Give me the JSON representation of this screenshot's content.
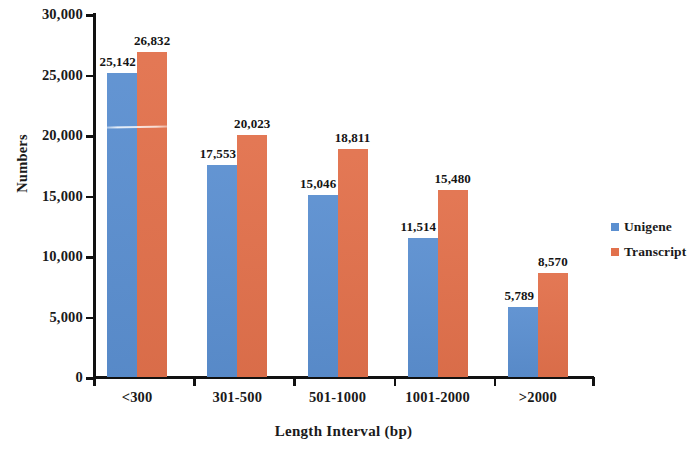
{
  "chart_data": {
    "type": "bar",
    "title": "",
    "subtitle": "",
    "xlabel": "Length Interval (bp)",
    "ylabel": "Numbers",
    "categories": [
      "<300",
      "301-500",
      "501-1000",
      "1001-2000",
      ">2000"
    ],
    "series": [
      {
        "name": "Unigene",
        "color": "#5b8fd0",
        "values": [
          25142,
          17553,
          15046,
          11514,
          5789
        ],
        "value_labels": [
          "25,142",
          "17,553",
          "15,046",
          "11,514",
          "5,789"
        ]
      },
      {
        "name": "Transcript",
        "color": "#e2714c",
        "values": [
          26832,
          20023,
          18811,
          15480,
          8570
        ],
        "value_labels": [
          "26,832",
          "20,023",
          "18,811",
          "15,480",
          "8,570"
        ]
      }
    ],
    "ylim": [
      0,
      30000
    ],
    "ytick_values": [
      0,
      5000,
      10000,
      15000,
      20000,
      25000,
      30000
    ],
    "ytick_labels": [
      "0",
      "5,000",
      "10,000",
      "15,000",
      "20,000",
      "25,000",
      "30,000"
    ],
    "grid": false,
    "legend_position": "right",
    "legend_entries": [
      "Unigene",
      "Transcript"
    ]
  }
}
